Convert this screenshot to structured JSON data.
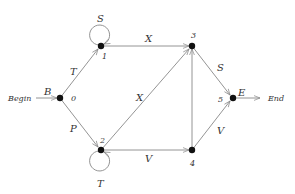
{
  "diagram": {
    "type": "state-transition-graph",
    "background": "#ffffff",
    "colors": {
      "edge": "#888888",
      "node": "#111111",
      "text": "#333333"
    },
    "io": {
      "begin_label": "Begin",
      "end_label": "End"
    },
    "nodes": [
      {
        "id": "0",
        "index_label": "0",
        "state_label": "B",
        "x": 60,
        "y": 98
      },
      {
        "id": "1",
        "index_label": "1",
        "state_label": "",
        "x": 101,
        "y": 46
      },
      {
        "id": "2",
        "index_label": "2",
        "state_label": "",
        "x": 101,
        "y": 150
      },
      {
        "id": "3",
        "index_label": "3",
        "state_label": "",
        "x": 192,
        "y": 46
      },
      {
        "id": "4",
        "index_label": "4",
        "state_label": "",
        "x": 192,
        "y": 150
      },
      {
        "id": "5",
        "index_label": "5",
        "state_label": "E",
        "x": 233,
        "y": 98
      }
    ],
    "edges": [
      {
        "from": "begin",
        "to": "0",
        "label": ""
      },
      {
        "from": "0",
        "to": "1",
        "label": "T"
      },
      {
        "from": "0",
        "to": "2",
        "label": "P"
      },
      {
        "from": "1",
        "to": "1",
        "label": "S",
        "self_loop": true
      },
      {
        "from": "2",
        "to": "2",
        "label": "T",
        "self_loop": true
      },
      {
        "from": "1",
        "to": "3",
        "label": "X"
      },
      {
        "from": "2",
        "to": "3",
        "label": "X"
      },
      {
        "from": "2",
        "to": "4",
        "label": "V"
      },
      {
        "from": "4",
        "to": "3",
        "label": ""
      },
      {
        "from": "3",
        "to": "5",
        "label": "S"
      },
      {
        "from": "4",
        "to": "5",
        "label": "V"
      },
      {
        "from": "5",
        "to": "end",
        "label": ""
      }
    ]
  }
}
